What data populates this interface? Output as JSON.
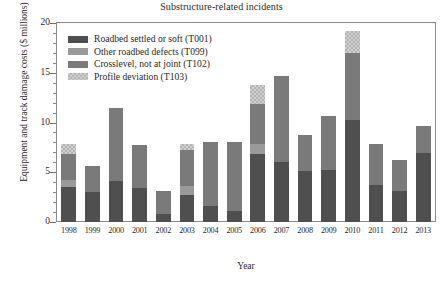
{
  "chart_data": {
    "type": "bar",
    "subtype": "stacked-bar",
    "title": "Substructure-related incidents",
    "xlabel": "Year",
    "ylabel": "Equipment and track damage costs ($ millions)",
    "ylim": [
      0,
      20
    ],
    "ytick_labels": [
      "0",
      "5",
      "10",
      "15",
      "20"
    ],
    "ytick_values": [
      0,
      5,
      10,
      15,
      20
    ],
    "grid": false,
    "legend_position": "upper-left-inside",
    "categories": [
      "1998",
      "1999",
      "2000",
      "2001",
      "2002",
      "2003",
      "2004",
      "2005",
      "2006",
      "2007",
      "2008",
      "2009",
      "2010",
      "2011",
      "2012",
      "2013"
    ],
    "series": [
      {
        "name": "Roadbed settled or soft (T001)",
        "code": "T001",
        "color": "#4f4f4f",
        "values": [
          3.5,
          3.0,
          4.1,
          3.4,
          0.8,
          2.7,
          1.6,
          1.1,
          6.8,
          6.0,
          5.1,
          5.2,
          10.3,
          3.7,
          3.1,
          6.9
        ]
      },
      {
        "name": "Other roadbed defects (T099)",
        "code": "T099",
        "color": "#9a9a9a",
        "values": [
          0.7,
          0.0,
          0.0,
          0.0,
          0.0,
          0.9,
          0.0,
          0.0,
          1.0,
          0.0,
          0.0,
          0.0,
          0.0,
          0.0,
          0.0,
          0.0
        ]
      },
      {
        "name": "Crosslevel, not at joint (T102)",
        "code": "T102",
        "color": "#7a7a7a",
        "values": [
          2.6,
          2.6,
          7.4,
          4.3,
          2.3,
          3.6,
          6.4,
          6.9,
          4.1,
          8.7,
          3.6,
          5.5,
          6.7,
          4.1,
          3.1,
          2.8
        ]
      },
      {
        "name": "Profile deviation (T103)",
        "code": "T103",
        "color": "#cfcfcf",
        "values": [
          1.0,
          0.0,
          0.0,
          0.0,
          0.0,
          0.6,
          0.0,
          0.0,
          1.9,
          0.0,
          0.0,
          0.0,
          2.2,
          0.0,
          0.0,
          0.0
        ]
      }
    ],
    "totals": [
      7.8,
      5.6,
      11.5,
      7.7,
      3.1,
      7.8,
      8.0,
      8.0,
      13.8,
      14.7,
      8.7,
      10.7,
      19.2,
      7.8,
      6.2,
      9.7
    ]
  },
  "legend": {
    "items": [
      {
        "label": "Roadbed settled or soft (T001)"
      },
      {
        "label": "Other roadbed defects (T099)"
      },
      {
        "label": "Crosslevel, not at joint (T102)"
      },
      {
        "label": "Profile deviation (T103)"
      }
    ]
  }
}
